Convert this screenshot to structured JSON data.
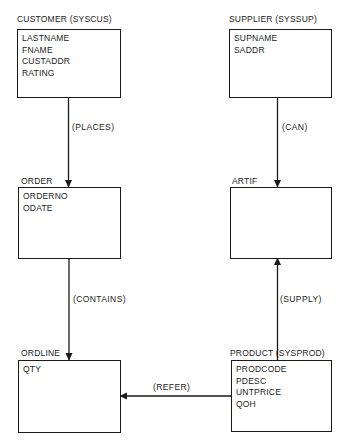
{
  "diagram": {
    "type": "entity-relationship",
    "entities": [
      {
        "id": "customer",
        "name": "CUSTOMER",
        "system_name": "(SYSCUS)",
        "label": "CUSTOMER (SYSCUS)",
        "attributes": [
          "LASTNAME",
          "FNAME",
          "CUSTADDR",
          "RATING"
        ]
      },
      {
        "id": "supplier",
        "name": "SUPPLIER",
        "system_name": "(SYSSUP)",
        "label": "SUPPLIER  (SYSSUP)",
        "attributes": [
          "SUPNAME",
          "SADDR"
        ]
      },
      {
        "id": "order",
        "name": "ORDER",
        "label": "ORDER",
        "attributes": [
          "ORDERNO",
          "ODATE"
        ]
      },
      {
        "id": "artif",
        "name": "ARTIF",
        "label": "ARTIF",
        "attributes": []
      },
      {
        "id": "ordline",
        "name": "ORDLINE",
        "label": "ORDLINE",
        "attributes": [
          "QTY"
        ]
      },
      {
        "id": "product",
        "name": "PRODUCT",
        "system_name": "(SYSPROD)",
        "label": "PRODUCT   (SYSPROD)",
        "attributes": [
          "PRODCODE",
          "PDESC",
          "UNTPRICE",
          "QOH"
        ]
      }
    ],
    "relationships": [
      {
        "id": "places",
        "label": "(PLACES)",
        "from": "CUSTOMER",
        "to": "ORDER"
      },
      {
        "id": "can",
        "label": "(CAN)",
        "from": "SUPPLIER",
        "to": "ARTIF"
      },
      {
        "id": "contains",
        "label": "(CONTAINS)",
        "from": "ORDER",
        "to": "ORDLINE"
      },
      {
        "id": "supply",
        "label": "(SUPPLY)",
        "from": "PRODUCT",
        "to": "ARTIF"
      },
      {
        "id": "refer",
        "label": "(REFER)",
        "from": "PRODUCT",
        "to": "ORDLINE"
      }
    ],
    "colors": {
      "line": "#1a1a1a",
      "background": "#ffffff"
    }
  }
}
